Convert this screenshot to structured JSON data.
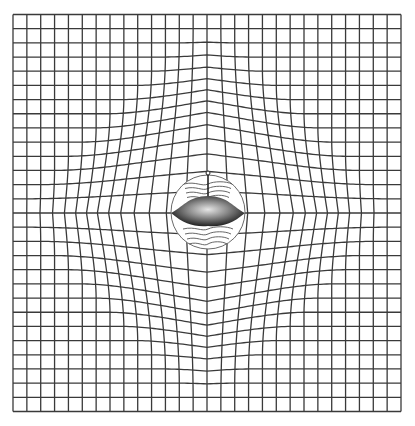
{
  "illustration": {
    "title": "Bulging grid optical illusion with flying saucer",
    "canvas": {
      "width": 415,
      "height": 426,
      "background": "#ffffff"
    },
    "grid": {
      "left": 13,
      "top": 15,
      "right": 401,
      "bottom": 412,
      "cells": 28,
      "line_color": "#3a3a3a",
      "line_width": 1.3,
      "center_x": 207,
      "center_y": 213,
      "bulge_strength": 0.62
    },
    "circle": {
      "cx": 208,
      "cy": 212,
      "r": 37,
      "stroke": "#6a6a6a"
    },
    "saucer": {
      "cx": 208,
      "body_top_y": 196,
      "rim_y": 213,
      "half_width": 37,
      "bottom_y": 226,
      "antenna_top_y": 173,
      "antenna_ball_r": 2,
      "gradient_light": "#d8d8d8",
      "gradient_dark": "#151515"
    },
    "wave_lines": {
      "upper_count": 4,
      "lower_count": 4,
      "color": "#555555"
    }
  }
}
